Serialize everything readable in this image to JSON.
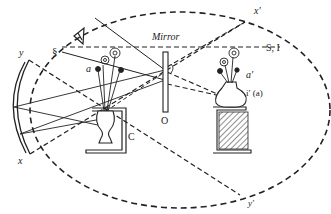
{
  "diagram": {
    "labels": {
      "mirror": "Mirror",
      "object_marker": "O",
      "s_i": "S, I",
      "a": "a",
      "a_prime": "a′",
      "i_prime_a": "i′ (a)",
      "c": "C",
      "x": "x",
      "x_prime": "x′",
      "y": "y",
      "y_prime": "y′",
      "s_symbol": "§"
    },
    "icons": {
      "eye": "eye-icon",
      "flowers_real": "flower-bouquet",
      "flowers_image": "flower-bouquet-image",
      "vase_real": "vase",
      "vase_image": "vase-image",
      "box": "box-c",
      "stand": "hatched-stand",
      "concave_mirror": "concave-mirror-arc",
      "plane_mirror": "plane-mirror"
    },
    "colors": {
      "ink": "#222222",
      "background": "#ffffff"
    }
  }
}
